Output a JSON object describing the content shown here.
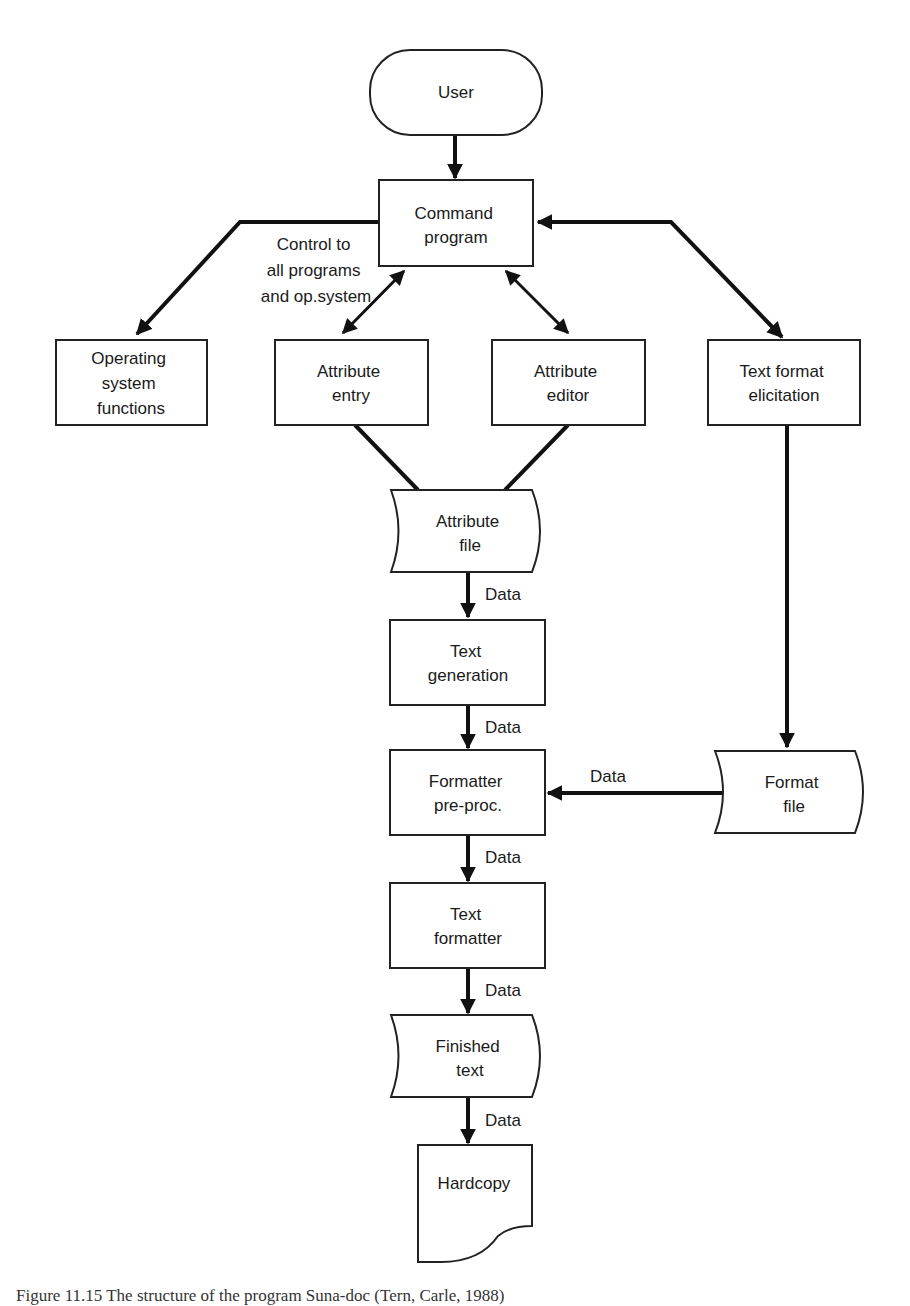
{
  "diagram": {
    "type": "flowchart",
    "nodes": {
      "user": {
        "label_lines": [
          "User"
        ],
        "shape": "terminal"
      },
      "command_program": {
        "label_lines": [
          "Command",
          "program"
        ],
        "shape": "process"
      },
      "operating_system": {
        "label_lines": [
          "Operating",
          "system",
          "functions"
        ],
        "shape": "process"
      },
      "attribute_entry": {
        "label_lines": [
          "Attribute",
          "entry"
        ],
        "shape": "process"
      },
      "attribute_editor": {
        "label_lines": [
          "Attribute",
          "editor"
        ],
        "shape": "process"
      },
      "text_format_elicitation": {
        "label_lines": [
          "Text format",
          "elicitation"
        ],
        "shape": "process"
      },
      "attribute_file": {
        "label_lines": [
          "Attribute",
          "file"
        ],
        "shape": "stored-data"
      },
      "text_generation": {
        "label_lines": [
          "Text",
          "generation"
        ],
        "shape": "process"
      },
      "formatter_preproc": {
        "label_lines": [
          "Formatter",
          "pre-proc."
        ],
        "shape": "process"
      },
      "format_file": {
        "label_lines": [
          "Format",
          "file"
        ],
        "shape": "stored-data"
      },
      "text_formatter": {
        "label_lines": [
          "Text",
          "formatter"
        ],
        "shape": "process"
      },
      "finished_text": {
        "label_lines": [
          "Finished",
          "text"
        ],
        "shape": "stored-data"
      },
      "hardcopy": {
        "label_lines": [
          "Hardcopy"
        ],
        "shape": "document"
      }
    },
    "edge_labels": {
      "control": [
        "Control to",
        "all programs",
        "and op.system"
      ],
      "data": "Data"
    },
    "edges": [
      {
        "from": "user",
        "to": "command_program",
        "label": ""
      },
      {
        "from": "command_program",
        "to": "operating_system",
        "label": "Control to all programs and op.system"
      },
      {
        "from": "command_program",
        "to": "attribute_entry",
        "label": "",
        "bidirectional": true
      },
      {
        "from": "command_program",
        "to": "attribute_editor",
        "label": "",
        "bidirectional": true
      },
      {
        "from": "command_program",
        "to": "text_format_elicitation",
        "label": "",
        "bidirectional": true
      },
      {
        "from": "attribute_entry",
        "to": "attribute_file",
        "label": ""
      },
      {
        "from": "attribute_editor",
        "to": "attribute_file",
        "label": ""
      },
      {
        "from": "attribute_file",
        "to": "text_generation",
        "label": "Data"
      },
      {
        "from": "text_generation",
        "to": "formatter_preproc",
        "label": "Data"
      },
      {
        "from": "text_format_elicitation",
        "to": "format_file",
        "label": ""
      },
      {
        "from": "format_file",
        "to": "formatter_preproc",
        "label": "Data"
      },
      {
        "from": "formatter_preproc",
        "to": "text_formatter",
        "label": "Data"
      },
      {
        "from": "text_formatter",
        "to": "finished_text",
        "label": "Data"
      },
      {
        "from": "finished_text",
        "to": "hardcopy",
        "label": "Data"
      }
    ]
  },
  "caption": "Figure 11.15   The structure of the program Suna-doc (Tern, Carle, 1988)"
}
